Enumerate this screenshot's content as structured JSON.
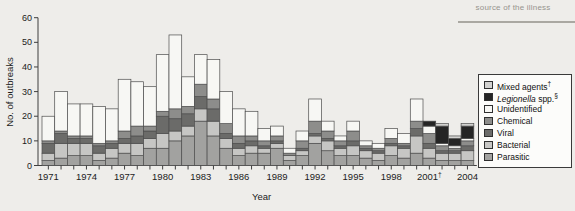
{
  "page": {
    "top_fragment_text": "source of the illness"
  },
  "chart_data": {
    "type": "bar",
    "subtype": "stacked-vertical",
    "title": "",
    "xlabel": "Year",
    "ylabel": "No. of outbreaks",
    "ylim": [
      0,
      60
    ],
    "yticks": [
      0,
      10,
      20,
      30,
      40,
      50,
      60
    ],
    "grid": "off",
    "legend_position": "right-box",
    "years": [
      1971,
      1972,
      1973,
      1974,
      1975,
      1976,
      1977,
      1978,
      1979,
      1980,
      1981,
      1982,
      1983,
      1984,
      1985,
      1986,
      1987,
      1988,
      1989,
      1990,
      1991,
      1992,
      1993,
      1994,
      1995,
      1996,
      1997,
      1998,
      1999,
      2000,
      2001,
      2002,
      2003,
      2004
    ],
    "x_ticks": [
      {
        "index": 0,
        "label": "1971"
      },
      {
        "index": 3,
        "label": "1974"
      },
      {
        "index": 6,
        "label": "1977"
      },
      {
        "index": 9,
        "label": "1980"
      },
      {
        "index": 12,
        "label": "1983"
      },
      {
        "index": 15,
        "label": "1986"
      },
      {
        "index": 18,
        "label": "1989"
      },
      {
        "index": 21,
        "label": "1992"
      },
      {
        "index": 24,
        "label": "1995"
      },
      {
        "index": 27,
        "label": "1998"
      },
      {
        "index": 30,
        "label": "2001",
        "sup": "†"
      },
      {
        "index": 33,
        "label": "2004"
      }
    ],
    "totals": [
      20,
      30,
      25,
      25,
      24,
      23,
      35,
      34,
      32,
      45,
      53,
      36,
      45,
      43,
      30,
      23,
      22,
      15,
      16,
      7,
      14,
      27,
      18,
      12,
      18,
      10,
      9,
      15,
      13,
      27,
      18,
      17,
      12,
      17
    ],
    "series": [
      {
        "name": "Parasitic",
        "color": "#a2a2a0",
        "values": [
          2,
          3,
          4,
          4,
          2,
          3,
          5,
          4,
          7,
          7,
          10,
          12,
          18,
          12,
          7,
          4,
          5,
          5,
          7,
          2,
          4,
          9,
          6,
          4,
          4,
          3,
          2,
          4,
          3,
          5,
          3,
          2,
          2,
          2
        ]
      },
      {
        "name": "Bacterial",
        "color": "#c6c6c4",
        "values": [
          3,
          6,
          5,
          5,
          3,
          4,
          4,
          5,
          4,
          6,
          4,
          4,
          5,
          6,
          4,
          3,
          3,
          2,
          2,
          2,
          2,
          3,
          4,
          3,
          4,
          3,
          3,
          4,
          4,
          7,
          4,
          3,
          3,
          4
        ]
      },
      {
        "name": "Viral",
        "color": "#6b6b69",
        "values": [
          4,
          4,
          2,
          2,
          3,
          2,
          2,
          3,
          3,
          7,
          5,
          5,
          5,
          5,
          2,
          2,
          2,
          1,
          1,
          0,
          1,
          1,
          1,
          1,
          2,
          1,
          1,
          1,
          1,
          3,
          2,
          1,
          1,
          2
        ]
      },
      {
        "name": "Chemical",
        "color": "#8d8d8b",
        "values": [
          1,
          1,
          1,
          1,
          1,
          1,
          3,
          4,
          2,
          2,
          4,
          3,
          5,
          4,
          4,
          3,
          2,
          2,
          2,
          1,
          3,
          5,
          3,
          2,
          4,
          1,
          1,
          2,
          1,
          3,
          4,
          2,
          1,
          2
        ]
      },
      {
        "name": "Unidentified",
        "color": "#f7f7f4",
        "values": [
          10,
          16,
          13,
          13,
          15,
          13,
          21,
          18,
          16,
          23,
          30,
          12,
          12,
          16,
          13,
          11,
          10,
          5,
          4,
          2,
          4,
          9,
          4,
          2,
          4,
          2,
          2,
          4,
          4,
          9,
          3,
          1,
          1,
          1
        ]
      },
      {
        "name": "Legionella spp.",
        "color": "#252525",
        "values": [
          0,
          0,
          0,
          0,
          0,
          0,
          0,
          0,
          0,
          0,
          0,
          0,
          0,
          0,
          0,
          0,
          0,
          0,
          0,
          0,
          0,
          0,
          0,
          0,
          0,
          0,
          0,
          0,
          0,
          0,
          2,
          7,
          3,
          5
        ]
      },
      {
        "name": "Mixed agents",
        "color": "#d2d2d0",
        "values": [
          0,
          0,
          0,
          0,
          0,
          0,
          0,
          0,
          0,
          0,
          0,
          0,
          0,
          0,
          0,
          0,
          0,
          0,
          0,
          0,
          0,
          0,
          0,
          0,
          0,
          0,
          0,
          0,
          0,
          0,
          0,
          1,
          1,
          1
        ]
      }
    ],
    "legend": [
      {
        "text": "Mixed agents",
        "sup": "†",
        "color": "#d2d2d0"
      },
      {
        "italic": "Legionella",
        "text": " spp.",
        "sup": "§",
        "color": "#252525"
      },
      {
        "text": "Unidentified",
        "color": "#f7f7f4"
      },
      {
        "text": "Chemical",
        "color": "#8d8d8b"
      },
      {
        "text": "Viral",
        "color": "#6b6b69"
      },
      {
        "text": "Bacterial",
        "color": "#c6c6c4"
      },
      {
        "text": "Parasitic",
        "color": "#a2a2a0"
      }
    ]
  }
}
